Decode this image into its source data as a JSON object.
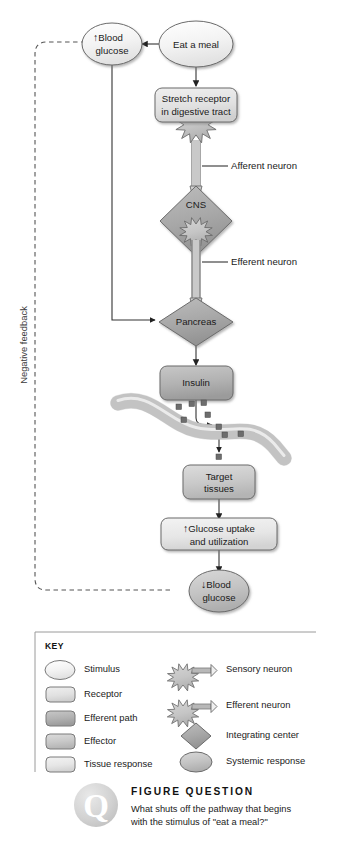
{
  "figure": {
    "pathway_label": "Negative feedback"
  },
  "colors": {
    "stimulus_fill": "#f2f2f2",
    "receptor_fill": "#e3e3e3",
    "efferent_path_fill": "#b0b0b0",
    "effector_fill": "#c9c9c9",
    "tissue_response_fill": "#e3e3e3",
    "systemic_response_fill": "#c4c4c4",
    "integrating_center_fill": "#a8a8a8",
    "neuron_fill": "#c9c9c9",
    "vessel_fill": "#dcdcdc",
    "insulin_dot": "#6d6d6d",
    "stroke": "#6b6b6b",
    "line": "#333333",
    "text": "#1a1a1a"
  },
  "nodes": {
    "eat_a_meal": {
      "label": "Eat a meal",
      "type": "stimulus"
    },
    "blood_glucose_up": {
      "arrow": "↑",
      "line1": "Blood",
      "line2": "glucose",
      "type": "systemic-response"
    },
    "stretch_receptor": {
      "line1": "Stretch receptor",
      "line2": "in digestive tract",
      "type": "receptor"
    },
    "cns": {
      "label": "CNS",
      "type": "integrating-center"
    },
    "pancreas": {
      "label": "Pancreas",
      "type": "integrating-center"
    },
    "insulin": {
      "label": "Insulin",
      "type": "efferent-path"
    },
    "target_tissues": {
      "line1": "Target",
      "line2": "tissues",
      "type": "effector"
    },
    "glucose_uptake": {
      "arrow": "↑",
      "line1": "Glucose uptake",
      "line2": "and utilization",
      "type": "tissue-response"
    },
    "blood_glucose_down": {
      "arrow": "↓",
      "line1": "Blood",
      "line2": "glucose",
      "type": "systemic-response"
    }
  },
  "annotations": {
    "afferent_neuron": "Afferent neuron",
    "efferent_neuron": "Efferent neuron"
  },
  "key": {
    "title": "KEY",
    "left_items": [
      {
        "label": "Stimulus",
        "shape": "ellipse",
        "fill": "#f2f2f2"
      },
      {
        "label": "Receptor",
        "shape": "rounded-rect",
        "fill": "#e3e3e3"
      },
      {
        "label": "Efferent path",
        "shape": "rounded-rect",
        "fill": "#b0b0b0"
      },
      {
        "label": "Effector",
        "shape": "rounded-rect",
        "fill": "#c9c9c9"
      },
      {
        "label": "Tissue response",
        "shape": "rounded-rect",
        "fill": "#e8e8e8"
      }
    ],
    "right_items": [
      {
        "label": "Sensory neuron",
        "shape": "neuron",
        "fill": "#c9c9c9"
      },
      {
        "label": "Efferent neuron",
        "shape": "neuron",
        "fill": "#c9c9c9"
      },
      {
        "label": "Integrating center",
        "shape": "diamond",
        "fill": "#a8a8a8"
      },
      {
        "label": "Systemic response",
        "shape": "ellipse",
        "fill": "#c4c4c4"
      }
    ]
  },
  "figure_question": {
    "badge": "Q",
    "heading": "FIGURE QUESTION",
    "line1": "What shuts off the pathway that begins",
    "line2": "with the stimulus of \"eat a meal?\""
  }
}
